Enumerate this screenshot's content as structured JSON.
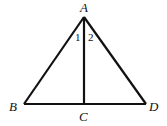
{
  "diagram": {
    "type": "geometry",
    "points": {
      "A": {
        "label": "A",
        "x": 84,
        "y": 17
      },
      "B": {
        "label": "B",
        "x": 24,
        "y": 104
      },
      "C": {
        "label": "C",
        "x": 84,
        "y": 104
      },
      "D": {
        "label": "D",
        "x": 146,
        "y": 104
      }
    },
    "segments": [
      "AB",
      "AD",
      "BD",
      "AC"
    ],
    "angle_labels": [
      {
        "label": "1",
        "at": "A",
        "side": "left of AC"
      },
      {
        "label": "2",
        "at": "A",
        "side": "right of AC"
      }
    ],
    "colors": {
      "stroke": "#111111",
      "background": "#ffffff"
    }
  }
}
